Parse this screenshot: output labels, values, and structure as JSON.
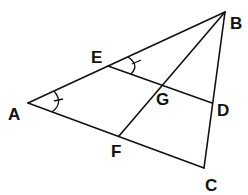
{
  "diagram": {
    "type": "geometry-triangle",
    "points": {
      "A": {
        "label": "A"
      },
      "B": {
        "label": "B"
      },
      "C": {
        "label": "C"
      },
      "D": {
        "label": "D"
      },
      "E": {
        "label": "E"
      },
      "F": {
        "label": "F"
      },
      "G": {
        "label": "G"
      }
    },
    "segments": [
      "AB",
      "BC",
      "CA",
      "ED",
      "BF"
    ],
    "intersections": [
      {
        "point": "G",
        "of": [
          "ED",
          "BF"
        ]
      }
    ],
    "angle_marks": [
      {
        "vertex": "A",
        "between": [
          "B",
          "C"
        ],
        "ticks": 1
      },
      {
        "vertex": "E",
        "between": [
          "B",
          "D"
        ],
        "ticks": 1
      }
    ],
    "colors": {
      "stroke": "#111111",
      "background": "#ffffff"
    }
  }
}
